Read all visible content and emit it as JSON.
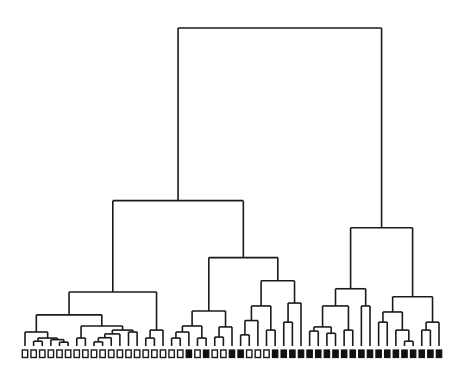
{
  "diagram": {
    "type": "dendrogram",
    "title": "",
    "orientation": "top-down",
    "height_units": "linkage distance (relative, root = 100)",
    "leaf_count": 49,
    "leaf_classes": [
      "open",
      "open",
      "open",
      "open",
      "open",
      "open",
      "open",
      "open",
      "open",
      "open",
      "open",
      "open",
      "open",
      "open",
      "open",
      "open",
      "open",
      "open",
      "open",
      "filled",
      "open",
      "filled",
      "open",
      "open",
      "filled",
      "filled",
      "open",
      "open",
      "open",
      "filled",
      "filled",
      "filled",
      "filled",
      "filled",
      "filled",
      "filled",
      "filled",
      "filled",
      "filled",
      "filled",
      "filled",
      "filled",
      "filled",
      "filled",
      "filled",
      "filled",
      "filled",
      "filled",
      "filled"
    ],
    "legend": {
      "open": "open square marker",
      "filled": "filled square marker"
    },
    "colors": {
      "line": "#1a1a1a",
      "filled_marker": "#111111",
      "open_marker_fill": "#ffffff"
    },
    "tree": {
      "h": 100,
      "children": [
        {
          "h": 45.7,
          "children": [
            {
              "h": 17,
              "children": [
                {
                  "h": 9.8,
                  "children": [
                    {
                      "h": 4.4,
                      "children": [
                        {
                          "leaf": 0
                        },
                        {
                          "h": 2.5,
                          "children": [
                            {
                              "h": 1.5,
                              "children": [
                                {
                                  "leaf": 1
                                },
                                {
                                  "leaf": 2
                                }
                              ]
                            },
                            {
                              "h": 2.0,
                              "children": [
                                {
                                  "leaf": 3
                                },
                                {
                                  "h": 1.2,
                                  "children": [
                                    {
                                      "leaf": 4
                                    },
                                    {
                                      "leaf": 5
                                    }
                                  ]
                                }
                              ]
                            }
                          ]
                        }
                      ]
                    },
                    {
                      "h": 6.3,
                      "children": [
                        {
                          "h": 2.5,
                          "children": [
                            {
                              "leaf": 6
                            },
                            {
                              "leaf": 7
                            }
                          ]
                        },
                        {
                          "h": 5.0,
                          "children": [
                            {
                              "h": 3.8,
                              "children": [
                                {
                                  "h": 2.6,
                                  "children": [
                                    {
                                      "h": 1.3,
                                      "children": [
                                        {
                                          "leaf": 8
                                        },
                                        {
                                          "leaf": 9
                                        }
                                      ]
                                    },
                                    {
                                      "leaf": 10
                                    }
                                  ]
                                },
                                {
                                  "leaf": 11
                                }
                              ]
                            },
                            {
                              "h": 4.4,
                              "children": [
                                {
                                  "leaf": 12
                                },
                                {
                                  "leaf": 13
                                }
                              ]
                            }
                          ]
                        }
                      ]
                    }
                  ]
                },
                {
                  "h": 5.0,
                  "children": [
                    {
                      "h": 2.5,
                      "children": [
                        {
                          "leaf": 14
                        },
                        {
                          "leaf": 15
                        }
                      ]
                    },
                    {
                      "leaf": 16
                    }
                  ]
                }
              ]
            },
            {
              "h": 27.8,
              "children": [
                {
                  "h": 11,
                  "children": [
                    {
                      "h": 6.3,
                      "children": [
                        {
                          "h": 4.4,
                          "children": [
                            {
                              "h": 2.5,
                              "children": [
                                {
                                  "leaf": 17
                                },
                                {
                                  "leaf": 18
                                }
                              ]
                            },
                            {
                              "leaf": 19
                            }
                          ]
                        },
                        {
                          "h": 2.5,
                          "children": [
                            {
                              "leaf": 20
                            },
                            {
                              "leaf": 21
                            }
                          ]
                        }
                      ]
                    },
                    {
                      "h": 6.0,
                      "children": [
                        {
                          "h": 2.8,
                          "children": [
                            {
                              "leaf": 22
                            },
                            {
                              "leaf": 23
                            }
                          ]
                        },
                        {
                          "leaf": 24
                        }
                      ]
                    }
                  ]
                },
                {
                  "h": 20.5,
                  "children": [
                    {
                      "h": 12.6,
                      "children": [
                        {
                          "h": 8.0,
                          "children": [
                            {
                              "h": 3.5,
                              "children": [
                                {
                                  "leaf": 25
                                },
                                {
                                  "leaf": 26
                                }
                              ]
                            },
                            {
                              "leaf": 27
                            }
                          ]
                        },
                        {
                          "h": 5.0,
                          "children": [
                            {
                              "leaf": 28
                            },
                            {
                              "leaf": 29
                            }
                          ]
                        }
                      ]
                    },
                    {
                      "h": 13.5,
                      "children": [
                        {
                          "h": 7.5,
                          "children": [
                            {
                              "leaf": 30
                            },
                            {
                              "leaf": 31
                            }
                          ]
                        },
                        {
                          "leaf": 32
                        }
                      ]
                    }
                  ]
                }
              ]
            }
          ]
        },
        {
          "h": 37.2,
          "children": [
            {
              "h": 18,
              "children": [
                {
                  "h": 12.6,
                  "children": [
                    {
                      "h": 6.0,
                      "children": [
                        {
                          "h": 4.7,
                          "children": [
                            {
                              "leaf": 33
                            },
                            {
                              "leaf": 34
                            }
                          ]
                        },
                        {
                          "h": 4.0,
                          "children": [
                            {
                              "leaf": 35
                            },
                            {
                              "leaf": 36
                            }
                          ]
                        }
                      ]
                    },
                    {
                      "h": 5.0,
                      "children": [
                        {
                          "leaf": 37
                        },
                        {
                          "leaf": 38
                        }
                      ]
                    }
                  ]
                },
                {
                  "h": 12.6,
                  "children": [
                    {
                      "leaf": 39
                    },
                    {
                      "leaf": 40
                    }
                  ]
                }
              ]
            },
            {
              "h": 15.5,
              "children": [
                {
                  "h": 10.7,
                  "children": [
                    {
                      "h": 7.5,
                      "children": [
                        {
                          "leaf": 41
                        },
                        {
                          "leaf": 42
                        }
                      ]
                    },
                    {
                      "h": 5.0,
                      "children": [
                        {
                          "leaf": 43
                        },
                        {
                          "h": 1.5,
                          "children": [
                            {
                              "leaf": 44
                            },
                            {
                              "leaf": 45
                            }
                          ]
                        }
                      ]
                    }
                  ]
                },
                {
                  "h": 7.5,
                  "children": [
                    {
                      "h": 5.0,
                      "children": [
                        {
                          "leaf": 46
                        },
                        {
                          "leaf": 47
                        }
                      ]
                    },
                    {
                      "leaf": 48
                    }
                  ]
                }
              ]
            }
          ]
        }
      ]
    }
  }
}
